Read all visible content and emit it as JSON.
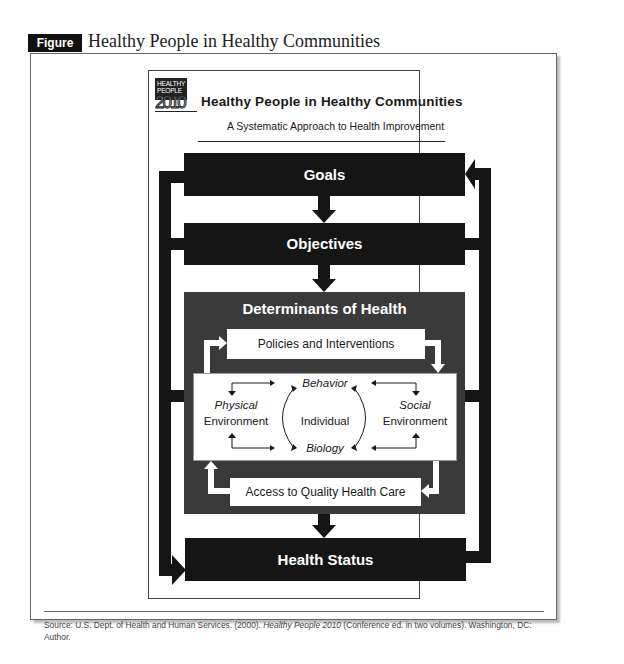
{
  "figure": {
    "label": "Figure 8.1",
    "title": "Healthy People in Healthy Communities"
  },
  "poster": {
    "logo": {
      "line1": "HEALTHY",
      "line2": "PEOPLE",
      "year": "2010"
    },
    "title": "Healthy People in Healthy Communities",
    "subtitle": "A Systematic Approach to Health Improvement"
  },
  "diagram": {
    "goals": "Goals",
    "objectives": "Objectives",
    "determinants": {
      "title": "Determinants of Health",
      "policies": "Policies and Interventions",
      "access": "Access to Quality Health Care",
      "center": {
        "behavior": "Behavior",
        "individual": "Individual",
        "biology": "Biology",
        "physical_line1": "Physical",
        "physical_line2": "Environment",
        "social_line1": "Social",
        "social_line2": "Environment"
      }
    },
    "health_status": "Health Status",
    "flow": [
      "Goals",
      "Objectives",
      "Determinants of Health",
      "Health Status"
    ],
    "colors": {
      "primary_box": "#151515",
      "determinants_box": "#3a3a3a",
      "inner_box": "#ffffff"
    }
  },
  "source": {
    "prefix": "Source: U.S. Dept. of Health and Human Services. (2000). ",
    "italic": "Healthy People 2010",
    "suffix": " (Conference ed. in two volumes). Washington, DC: Author."
  }
}
